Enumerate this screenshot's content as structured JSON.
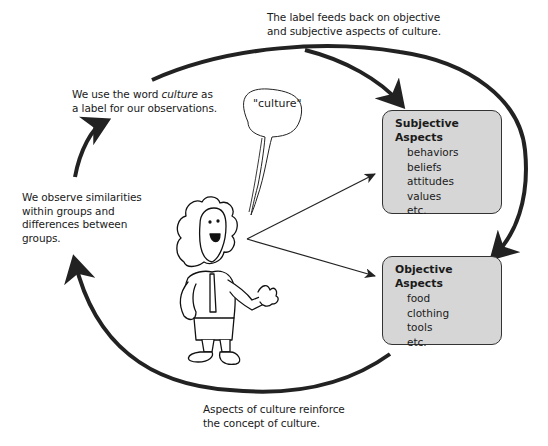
{
  "diagram": {
    "captions": {
      "top": [
        "The label feeds back on objective",
        "and subjective aspects of culture."
      ],
      "label": {
        "pre": "We use the word ",
        "italic": "culture",
        "post": " as",
        "line2": "a label for our observations."
      },
      "observe": [
        "We observe similarities",
        "within groups and",
        "differences between",
        "groups."
      ],
      "bottom": [
        "Aspects of culture reinforce",
        "the concept of culture."
      ]
    },
    "speech_bubble": "\"culture\"",
    "subjective_box": {
      "title": "Subjective Aspects",
      "items": [
        "behaviors",
        "beliefs",
        "attitudes",
        "values",
        "etc."
      ]
    },
    "objective_box": {
      "title": "Objective Aspects",
      "items": [
        "food",
        "clothing",
        "tools",
        "etc."
      ]
    },
    "colors": {
      "box_fill": "#d6d6d6",
      "stroke": "#222222"
    }
  }
}
